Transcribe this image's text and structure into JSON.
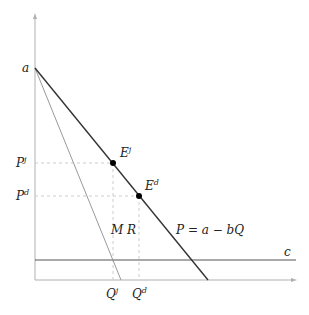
{
  "diagram": {
    "type": "monopoly-demand-diagram",
    "axes": {
      "x_axis_arrow": true,
      "y_axis_arrow": true
    },
    "labels": {
      "intercept": "a",
      "price_joint": "P",
      "price_joint_sup": "j",
      "price_disjoint": "P",
      "price_disjoint_sup": "d",
      "eq_joint": "E",
      "eq_joint_sup": "j",
      "eq_disjoint": "E",
      "eq_disjoint_sup": "d",
      "marginal_revenue": "M R",
      "demand": "P = a − bQ",
      "cost": "c",
      "qty_joint": "Q",
      "qty_joint_sup": "j",
      "qty_disjoint": "Q",
      "qty_disjoint_sup": "d"
    },
    "colors": {
      "axis": "#b0b0b0",
      "demand": "#333333",
      "mr": "#999999",
      "cost": "#555555",
      "guide": "#cccccc",
      "point": "#000000"
    }
  }
}
